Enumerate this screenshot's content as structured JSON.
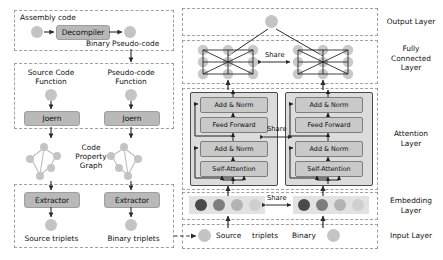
{
  "figure": {
    "left_panel": {
      "decompile_group": {
        "title": "Assembly code",
        "box_label": "Decompiler",
        "output_label": "Binary Pseudo-code"
      },
      "parse_group": {
        "left_title_line1": "Source Code",
        "left_title_line2": "Function",
        "right_title_line1": "Pseudo-code",
        "right_title_line2": "Function",
        "left_tool": "Joern",
        "right_tool": "Joern"
      },
      "cpg_label_line1": "Code",
      "cpg_label_line2": "Property",
      "cpg_label_line3": "Graph",
      "extract_group": {
        "left_box": "Extractor",
        "right_box": "Extractor",
        "left_output": "Source triplets",
        "right_output": "Binary triplets"
      }
    },
    "right_panel": {
      "layer_labels": [
        "Output Layer",
        "Fully\nConnected\nLayer",
        "Attention\nLayer",
        "Embedding\nLayer",
        "Input Layer"
      ],
      "layer_label_output": "Output Layer",
      "layer_label_fc_l1": "Fully",
      "layer_label_fc_l2": "Connected",
      "layer_label_fc_l3": "Layer",
      "layer_label_attn_l1": "Attention",
      "layer_label_attn_l2": "Layer",
      "layer_label_emb_l1": "Embedding",
      "layer_label_emb_l2": "Layer",
      "layer_label_input": "Input Layer",
      "share_fc": "Share",
      "share_attention": "Share",
      "share_embedding": "Share",
      "transformer_blocks": {
        "left": [
          "Add & Norm",
          "Feed Forward",
          "Add & Norm",
          "Self-Attention"
        ],
        "right": [
          "Add & Norm",
          "Feed Forward",
          "Add & Norm",
          "Self-Attention"
        ]
      },
      "input_tokens": [
        "Source",
        "triplets",
        "Binary"
      ],
      "embedding_dots_left": [
        "#4a4a4a",
        "#7d7d7d",
        "#b3b3b3",
        "#cfcfcf"
      ],
      "embedding_dots_right": [
        "#4a4a4a",
        "#7d7d7d",
        "#b3b3b3",
        "#cfcfcf"
      ]
    }
  },
  "colors": {
    "process_box": "#b9b9b9",
    "inner_box": "#c9c9c9",
    "node": "#c4c4c4",
    "dashed_border": "#9aa0a6",
    "stroke": "#2b2b2b"
  }
}
